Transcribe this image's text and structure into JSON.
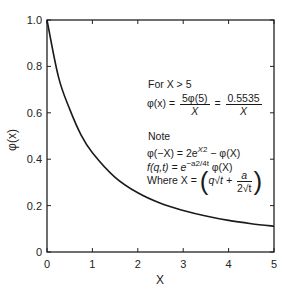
{
  "chart_data": {
    "type": "line",
    "title": "",
    "xlabel": "X",
    "ylabel": "φ(x)",
    "xlim": [
      0,
      5
    ],
    "ylim": [
      0,
      1.0
    ],
    "grid": false,
    "x_ticks": [
      "0",
      "1",
      "2",
      "3",
      "4",
      "5"
    ],
    "y_ticks": [
      "0",
      "0.2",
      "0.4",
      "0.6",
      "0.8",
      "1.0"
    ],
    "series": [
      {
        "name": "φ(x)",
        "x": [
          0,
          0.25,
          0.5,
          0.75,
          1.0,
          1.5,
          2.0,
          2.5,
          3.0,
          3.5,
          4.0,
          4.5,
          5.0
        ],
        "values": [
          1.0,
          0.756,
          0.616,
          0.505,
          0.428,
          0.322,
          0.255,
          0.21,
          0.179,
          0.155,
          0.136,
          0.122,
          0.111
        ]
      }
    ],
    "annotations": {
      "line1": "For X > 5",
      "line2_lhs": "φ(x) =",
      "line2_num1": "5φ(5)",
      "line2_den1": "X",
      "line2_eq": "=",
      "line2_num2": "0.5535",
      "line2_den2": "X",
      "note": "Note",
      "line3": "φ(−X) = 2e",
      "line3_sup": "X2",
      "line3_tail": " − φ(X)",
      "line4": "f(q,t) = e",
      "line4_sup": "−a2/4t",
      "line4_tail": " φ(X)",
      "line5_lhs": "Where X =",
      "line5_term1": "q√t +",
      "line5_num": "a",
      "line5_den": "2√t"
    }
  }
}
